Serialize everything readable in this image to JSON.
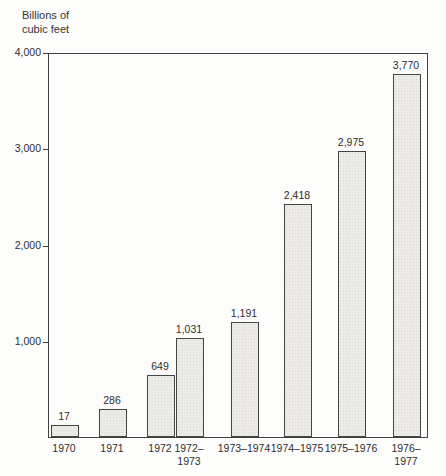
{
  "figure": {
    "unit_label_line1": "Billions of",
    "unit_label_line2": "cubic feet"
  },
  "chart_data": {
    "type": "bar",
    "title": "",
    "ylabel": "Billions of cubic feet",
    "xlabel": "",
    "categories": [
      "1970",
      "1971",
      "1972",
      "1972–1973",
      "1973–1974",
      "1974–1975",
      "1975–1976",
      "1976–1977"
    ],
    "values": [
      17,
      286,
      649,
      1031,
      1191,
      2418,
      2975,
      3770
    ],
    "value_labels": [
      "17",
      "286",
      "649",
      "1,031",
      "1,191",
      "2,418",
      "2,975",
      "3,770"
    ],
    "x_tick_labels": [
      "1970",
      "1971",
      "1972",
      "1972–\n1973",
      "1973–1974",
      "1974–1975",
      "1975–1976",
      "1976–1977"
    ],
    "y_ticks": [
      1000,
      2000,
      3000,
      4000
    ],
    "y_tick_labels": [
      "1,000",
      "2,000",
      "3,000",
      "4,000"
    ],
    "ylim": [
      0,
      4000
    ],
    "grid": false,
    "legend": false,
    "bar_fill_color": "#edebe7",
    "bar_border_color": "#454545",
    "axis_color": "#3f3f3f",
    "layout": {
      "bar_left_px": [
        2,
        50,
        98,
        127,
        182,
        235,
        289,
        344
      ],
      "bar_width_px": 28,
      "min_bar_px": 12,
      "note_adjacent_bars": "1972 and 1972–1973 bars touch"
    }
  }
}
